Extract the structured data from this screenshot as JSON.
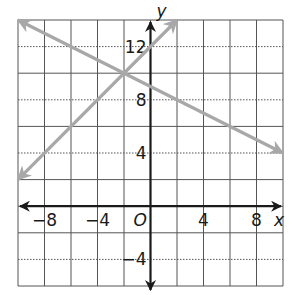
{
  "chart_data": {
    "type": "line",
    "title": "",
    "xlabel": "x",
    "ylabel": "y",
    "origin_label": "O",
    "xlim": [
      -10,
      10
    ],
    "ylim": [
      -6,
      14
    ],
    "grid": true,
    "grid_step": 2,
    "x_ticks": [
      {
        "value": -8,
        "label": "−8"
      },
      {
        "value": -4,
        "label": "−4"
      },
      {
        "value": 4,
        "label": "4"
      },
      {
        "value": 8,
        "label": "8"
      }
    ],
    "y_ticks": [
      {
        "value": 12,
        "label": "12"
      },
      {
        "value": 8,
        "label": "8"
      },
      {
        "value": 4,
        "label": "4"
      },
      {
        "value": -4,
        "label": "−4"
      }
    ],
    "series": [
      {
        "name": "line 1",
        "equation": "y = -0.5x + 9",
        "slope": -0.5,
        "intercept": 9,
        "x": [
          -10,
          10
        ],
        "y": [
          14,
          4
        ],
        "arrows": "both",
        "color": "#a8a8a8"
      },
      {
        "name": "line 2",
        "equation": "y = x + 12",
        "slope": 1,
        "intercept": 12,
        "x": [
          -10,
          2
        ],
        "y": [
          2,
          14
        ],
        "arrows": "both",
        "color": "#a8a8a8"
      }
    ],
    "intersection": {
      "x": -2,
      "y": 10
    }
  },
  "colors": {
    "grid": "#555555",
    "axis": "#1a1a1a",
    "lines": "#a8a8a8"
  }
}
